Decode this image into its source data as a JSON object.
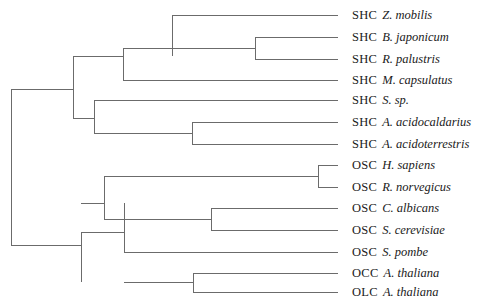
{
  "figure": {
    "kind": "phylogenetic-tree",
    "layout": "rectangular-cladogram",
    "orientation": "left-to-right",
    "line_color": "#6b6b6b",
    "background_color": "#ffffff",
    "text_color": "#1a1a1a",
    "leaf_count": 13
  },
  "leaves": [
    {
      "id": "shc-z-mobilis",
      "code": "SHC",
      "taxon": "Z. mobilis",
      "row": 0,
      "y": 15,
      "tip_x": 338
    },
    {
      "id": "shc-b-japonicum",
      "code": "SHC",
      "taxon": "B. japonicum",
      "row": 1,
      "y": 37,
      "tip_x": 338
    },
    {
      "id": "shc-r-palustris",
      "code": "SHC",
      "taxon": "R. palustris",
      "row": 2,
      "y": 59,
      "tip_x": 338
    },
    {
      "id": "shc-m-capsulatus",
      "code": "SHC",
      "taxon": "M. capsulatus",
      "row": 3,
      "y": 80,
      "tip_x": 338
    },
    {
      "id": "shc-s-sp",
      "code": "SHC",
      "taxon": "S. sp.",
      "row": 4,
      "y": 100,
      "tip_x": 338
    },
    {
      "id": "shc-a-acidocaldarius",
      "code": "SHC",
      "taxon": "A. acidocaldarius",
      "row": 5,
      "y": 122,
      "tip_x": 338
    },
    {
      "id": "shc-a-acidoterrestris",
      "code": "SHC",
      "taxon": "A. acidoterrestris",
      "row": 6,
      "y": 144,
      "tip_x": 338
    },
    {
      "id": "osc-h-sapiens",
      "code": "OSC",
      "taxon": "H. sapiens",
      "row": 7,
      "y": 165,
      "tip_x": 338
    },
    {
      "id": "osc-r-norvegicus",
      "code": "OSC",
      "taxon": "R. norvegicus",
      "row": 8,
      "y": 187,
      "tip_x": 338
    },
    {
      "id": "osc-c-albicans",
      "code": "OSC",
      "taxon": "C. albicans",
      "row": 9,
      "y": 208,
      "tip_x": 338
    },
    {
      "id": "osc-s-cerevisiae",
      "code": "OSC",
      "taxon": "S. cerevisiae",
      "row": 10,
      "y": 230,
      "tip_x": 338
    },
    {
      "id": "osc-s-pombe",
      "code": "OSC",
      "taxon": "S. pombe",
      "row": 11,
      "y": 252,
      "tip_x": 338
    },
    {
      "id": "occ-a-thaliana",
      "code": "OCC",
      "taxon": "A. thaliana",
      "row": 12,
      "y": 273,
      "tip_x": 338
    },
    {
      "id": "olc-a-thaliana",
      "code": "OLC",
      "taxon": "A. thaliana",
      "row": 13,
      "y": 292,
      "tip_x": 338
    }
  ],
  "label_x": 352,
  "branches": {
    "horizontal": [
      {
        "id": "h-z-mobilis",
        "x1": 172,
        "x2": 338,
        "y": 15
      },
      {
        "id": "h-b-japonicum",
        "x1": 255,
        "x2": 338,
        "y": 37
      },
      {
        "id": "h-r-palustris",
        "x1": 255,
        "x2": 338,
        "y": 59
      },
      {
        "id": "h-m-capsulatus",
        "x1": 123,
        "x2": 338,
        "y": 80
      },
      {
        "id": "h-s-sp",
        "x1": 94,
        "x2": 338,
        "y": 100
      },
      {
        "id": "h-a-acidocaldarius",
        "x1": 192,
        "x2": 338,
        "y": 122
      },
      {
        "id": "h-a-acidoterrestris",
        "x1": 192,
        "x2": 338,
        "y": 144
      },
      {
        "id": "h-h-sapiens",
        "x1": 318,
        "x2": 338,
        "y": 165
      },
      {
        "id": "h-r-norvegicus",
        "x1": 318,
        "x2": 338,
        "y": 187
      },
      {
        "id": "h-c-albicans",
        "x1": 211,
        "x2": 338,
        "y": 208
      },
      {
        "id": "h-s-cerevisiae",
        "x1": 211,
        "x2": 338,
        "y": 230
      },
      {
        "id": "h-s-pombe",
        "x1": 124,
        "x2": 338,
        "y": 252
      },
      {
        "id": "h-occ-a-thaliana",
        "x1": 193,
        "x2": 338,
        "y": 273
      },
      {
        "id": "h-olc-a-thaliana",
        "x1": 193,
        "x2": 338,
        "y": 292
      },
      {
        "id": "h-node-bj-rp",
        "x1": 123,
        "x2": 255,
        "y": 48
      },
      {
        "id": "h-node-shc-upper",
        "x1": 73,
        "x2": 123,
        "y": 56
      },
      {
        "id": "h-node-alicyclo",
        "x1": 94,
        "x2": 192,
        "y": 133
      },
      {
        "id": "h-node-shc-lower",
        "x1": 73,
        "x2": 94,
        "y": 118
      },
      {
        "id": "h-node-shc-root",
        "x1": 11,
        "x2": 73,
        "y": 89
      },
      {
        "id": "h-node-mammals",
        "x1": 104,
        "x2": 318,
        "y": 176
      },
      {
        "id": "h-node-yeasts",
        "x1": 104,
        "x2": 211,
        "y": 219
      },
      {
        "id": "h-node-fungi-mam",
        "x1": 81,
        "x2": 104,
        "y": 203
      },
      {
        "id": "h-node-osc",
        "x1": 81,
        "x2": 124,
        "y": 232
      },
      {
        "id": "h-node-plants",
        "x1": 124,
        "x2": 193,
        "y": 282
      },
      {
        "id": "h-node-osc-root",
        "x1": 11,
        "x2": 81,
        "y": 245
      }
    ],
    "vertical": [
      {
        "id": "v-bj-rp",
        "x": 255,
        "y1": 37,
        "y2": 59
      },
      {
        "id": "v-shc-upper",
        "x": 123,
        "y1": 48,
        "y2": 80
      },
      {
        "id": "v-zmob-clade",
        "x": 172,
        "y1": 15,
        "y2": 56
      },
      {
        "id": "v-alicyclo",
        "x": 192,
        "y1": 122,
        "y2": 144
      },
      {
        "id": "v-shc-lower",
        "x": 94,
        "y1": 100,
        "y2": 133
      },
      {
        "id": "v-shc-root",
        "x": 73,
        "y1": 56,
        "y2": 118
      },
      {
        "id": "v-mammals",
        "x": 318,
        "y1": 165,
        "y2": 187
      },
      {
        "id": "v-yeasts",
        "x": 211,
        "y1": 208,
        "y2": 230
      },
      {
        "id": "v-fungi-mam",
        "x": 104,
        "y1": 176,
        "y2": 219
      },
      {
        "id": "v-osc",
        "x": 124,
        "y1": 203,
        "y2": 252
      },
      {
        "id": "v-plants",
        "x": 193,
        "y1": 273,
        "y2": 292
      },
      {
        "id": "v-osc-root",
        "x": 81,
        "y1": 232,
        "y2": 282
      },
      {
        "id": "v-root",
        "x": 11,
        "y1": 89,
        "y2": 245
      }
    ]
  },
  "vertical_zmob_note": {
    "x": 172,
    "y1": 15,
    "y2": 56
  }
}
